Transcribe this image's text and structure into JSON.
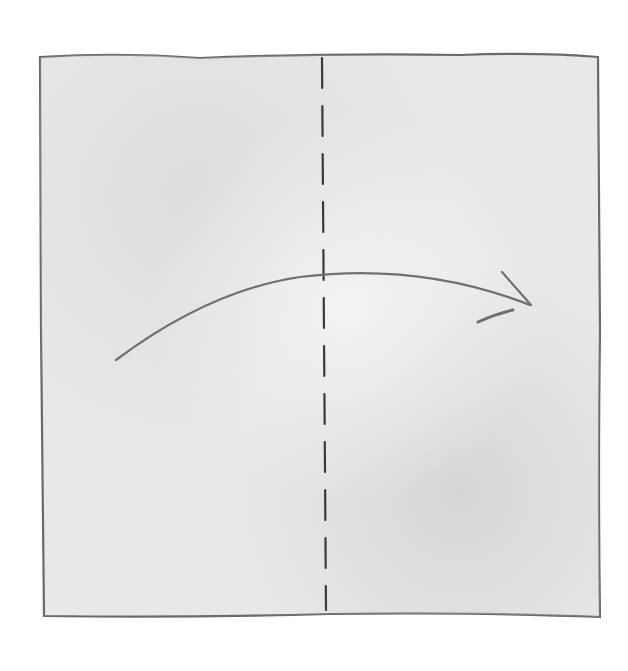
{
  "diagram": {
    "paper": {
      "shape": "square",
      "x": 40,
      "y": 54,
      "width": 560,
      "height": 563,
      "fill": "#e9e9e9",
      "edge_color": "#6a6a6a"
    },
    "fold_line": {
      "style": "dashed",
      "orientation": "vertical",
      "x": 324,
      "y1": 58,
      "y2": 610,
      "color": "#3a3a3a"
    },
    "arrow": {
      "direction": "left-to-right over the fold",
      "start": [
        116,
        360
      ],
      "control": [
        320,
        230
      ],
      "end": [
        530,
        305
      ],
      "color": "#6e6e6e"
    },
    "text_labels": []
  }
}
